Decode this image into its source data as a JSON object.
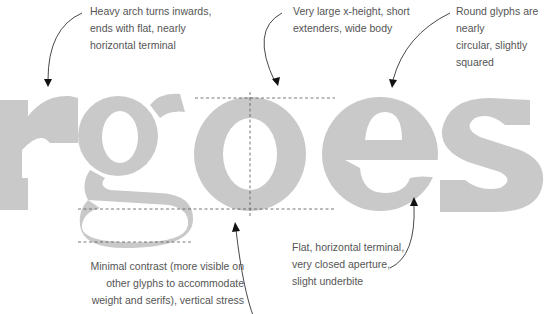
{
  "specimen": {
    "word": "rgoes",
    "glyph_color": "#c9c9c9",
    "guide_color": "#555555",
    "arrow_color": "#333333"
  },
  "annotations": [
    {
      "id": "arch",
      "lines": [
        "Heavy arch turns inwards,",
        "ends with flat, nearly",
        "horizontal terminal"
      ]
    },
    {
      "id": "xheight",
      "lines": [
        "Very large x-height, short",
        "extenders, wide body"
      ]
    },
    {
      "id": "round",
      "lines": [
        "Round glyphs are nearly",
        "circular, slightly squared"
      ]
    },
    {
      "id": "terminal",
      "lines": [
        "Flat, horizontal terminal,",
        "very closed aperture,",
        "slight underbite"
      ]
    },
    {
      "id": "contrast",
      "lines": [
        "Minimal contrast (more visible on",
        "other glyphs to accommodate",
        "weight and serifs), vertical stress"
      ]
    }
  ]
}
